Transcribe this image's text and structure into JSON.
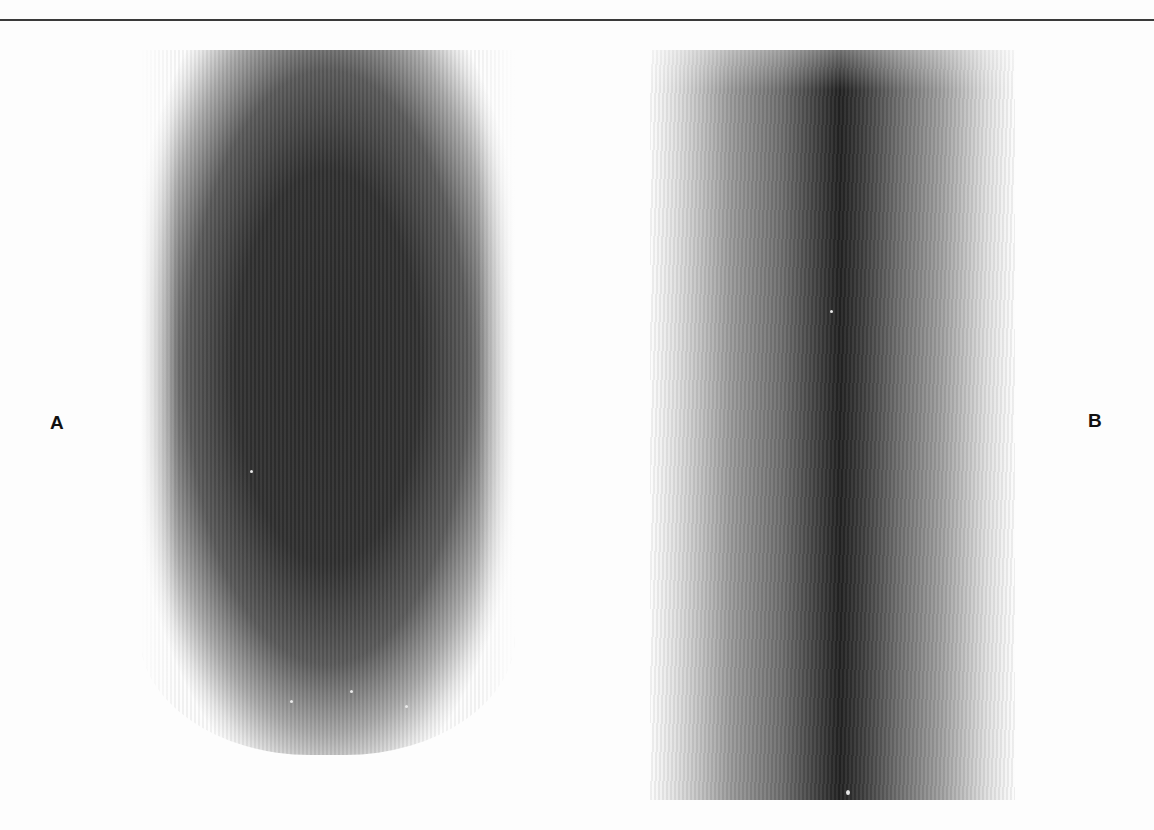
{
  "figure": {
    "panels": [
      {
        "id": "A",
        "label": "A",
        "description": "X-ray fiber diffraction photograph, broad diffuse dark oval"
      },
      {
        "id": "B",
        "label": "B",
        "description": "X-ray fiber diffraction photograph, narrow dark central streak"
      }
    ],
    "colors": {
      "background": "#fdfdfd",
      "rule": "#3a3a3a",
      "dark_center": "#2a2a2a"
    }
  }
}
